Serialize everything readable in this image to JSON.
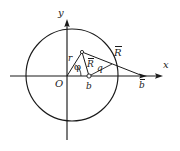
{
  "figure": {
    "type": "geometry-diagram",
    "background_color": "#ffffff",
    "stroke_color": "#1a1a1a",
    "axes": {
      "x_label": "x",
      "y_label": "y",
      "origin_label": "O"
    },
    "labels": {
      "r": "r",
      "phi": "φ",
      "R_vector": "R",
      "R_outer_vector": "R",
      "q": "q",
      "b": "b",
      "b_outer": "b"
    },
    "geometry": {
      "circle_center_x": 72,
      "circle_center_y": 75,
      "circle_radius": 46,
      "origin_x": 67,
      "origin_y": 76,
      "apex_x": 82,
      "apex_y": 52,
      "point_b_x": 89,
      "point_b_y": 76,
      "point_b_outer_x": 143,
      "point_b_outer_y": 76,
      "x_axis_start": 10,
      "x_axis_end": 163,
      "y_axis_top": 20,
      "y_axis_bottom": 140
    }
  }
}
